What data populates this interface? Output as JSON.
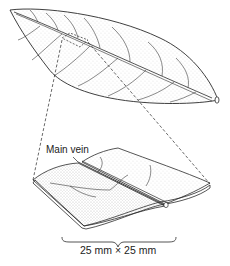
{
  "figure": {
    "type": "botanical-illustration",
    "labels": {
      "main_vein": "Main vein",
      "scale": "25 mm × 25 mm"
    },
    "colors": {
      "line": "#2a2a2a",
      "stipple": "#7a7a7a",
      "background": "#ffffff"
    }
  }
}
